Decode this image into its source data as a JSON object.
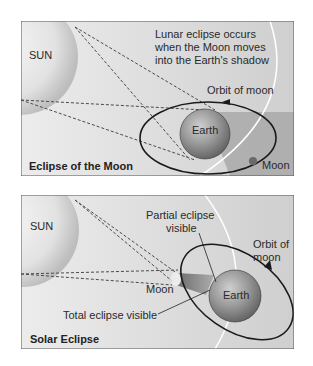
{
  "panels": [
    {
      "title": "Eclipse of the Moon",
      "sun_label": "SUN",
      "caption_lines": [
        "Lunar eclipse occurs",
        "when the Moon moves",
        "into the Earth's shadow"
      ],
      "orbit_label": "Orbit of moon",
      "earth_label": "Earth",
      "moon_label": "Moon"
    },
    {
      "title": "Solar Eclipse",
      "sun_label": "SUN",
      "partial_lines": [
        "Partial eclipse",
        "visible"
      ],
      "orbit_lines": [
        "Orbit of",
        "moon"
      ],
      "earth_label": "Earth",
      "moon_label": "Moon",
      "total_label": "Total eclipse visible"
    }
  ],
  "colors": {
    "background": "#d9d9d9",
    "sun": "#eeeeee",
    "earth": "#8c8c8c",
    "shadow": "#9a9a9a",
    "orbit": "#1a1a1a",
    "dashes": "#555555"
  }
}
